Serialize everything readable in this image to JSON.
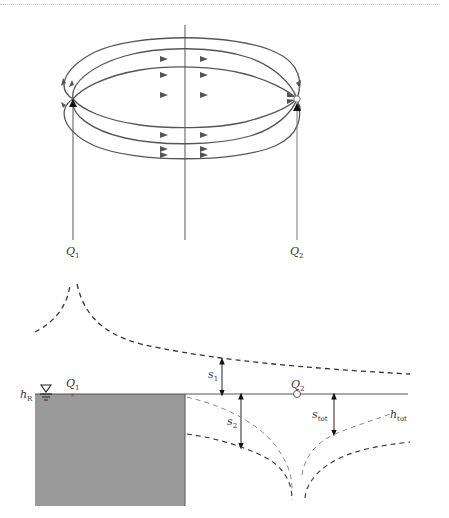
{
  "figure": {
    "top_panel": {
      "description": "Streamline pattern between injection well and extraction well",
      "wells": [
        {
          "id": "Q1",
          "label": "Q",
          "subscript": "1",
          "x": 73,
          "y": 99,
          "marker": "cross"
        },
        {
          "id": "Q2",
          "label": "Q",
          "subscript": "2",
          "x": 297,
          "y": 99,
          "marker": "circle"
        }
      ],
      "axis_line_x": 185,
      "streamline_count": 6
    },
    "bottom_panel": {
      "description": "Head profiles with river boundary",
      "river_label": {
        "main": "h",
        "sub": "R"
      },
      "well_labels": [
        {
          "main": "Q",
          "sub": "1"
        },
        {
          "main": "Q",
          "sub": "2"
        }
      ],
      "drawdown_labels": [
        {
          "main": "s",
          "sub": "1"
        },
        {
          "main": "s",
          "sub": "2"
        },
        {
          "main": "s",
          "sub": "tot"
        }
      ],
      "head_label": {
        "main": "h",
        "sub": "tot"
      },
      "colors": {
        "river_fill": "#9a9a9a",
        "line": "#555555",
        "dash_dark": "#333333",
        "dash_light": "#8a8a8a"
      }
    }
  }
}
